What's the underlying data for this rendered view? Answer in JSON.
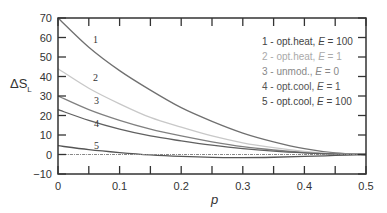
{
  "chart_data": {
    "type": "line",
    "title": "",
    "xlabel": "p",
    "ylabel": "ΔS_L",
    "xlim": [
      0,
      0.5
    ],
    "ylim": [
      -10,
      70
    ],
    "xticks": [
      0,
      0.1,
      0.2,
      0.3,
      0.4,
      0.5
    ],
    "xtick_labels": [
      "0",
      "0.1",
      "0.2",
      "0.3",
      "0.4",
      "0.5"
    ],
    "yticks": [
      -10,
      0,
      10,
      20,
      30,
      40,
      50,
      60,
      70
    ],
    "ytick_labels": [
      "-10",
      "0",
      "10",
      "20",
      "30",
      "40",
      "50",
      "60",
      "70"
    ],
    "grid": false,
    "legend_position": "upper right",
    "x": [
      0,
      0.05,
      0.1,
      0.15,
      0.2,
      0.25,
      0.3,
      0.35,
      0.4,
      0.45,
      0.5
    ],
    "series": [
      {
        "id": "1",
        "name": "1 - opt.heat, E=100",
        "color": "#707070",
        "values": [
          70,
          55,
          43,
          33,
          24,
          17,
          11,
          6.5,
          3,
          0.8,
          0
        ]
      },
      {
        "id": "2",
        "name": "2 - opt.heat, E=1",
        "color": "#c8c8c8",
        "values": [
          44,
          34,
          26,
          19,
          14,
          9.5,
          6,
          3.5,
          1.6,
          0.4,
          0
        ]
      },
      {
        "id": "3",
        "name": "3 - unmod., E=0",
        "color": "#808080",
        "values": [
          30,
          23,
          17.5,
          13,
          9.5,
          6.5,
          4,
          2.3,
          1,
          0.3,
          0
        ]
      },
      {
        "id": "4",
        "name": "4 - opt.cool, E=1",
        "color": "#606060",
        "values": [
          23,
          17.5,
          13,
          9.5,
          7,
          4.8,
          3,
          1.7,
          0.8,
          0.2,
          0
        ]
      },
      {
        "id": "5",
        "name": "5 - opt.cool, E=100",
        "color": "#555555",
        "values": [
          4.5,
          2.5,
          1,
          -0.2,
          -1,
          -1.5,
          -1.6,
          -1.4,
          -1,
          -0.5,
          0
        ]
      },
      {
        "id": "ref",
        "name": "zero reference",
        "color": "#888888",
        "dashed": true,
        "values": [
          0,
          0,
          0,
          0,
          0,
          0,
          0,
          0,
          0,
          0,
          0
        ]
      }
    ]
  },
  "legend": {
    "items": [
      {
        "num": "1 - ",
        "text": "opt.heat, ",
        "e": "E",
        "eq": " = 100",
        "color": "#444444"
      },
      {
        "num": "2 - ",
        "text": "opt.heat, ",
        "e": "E",
        "eq": " = 1",
        "color": "#aaaaaa"
      },
      {
        "num": "3 - ",
        "text": "unmod., ",
        "e": "E",
        "eq": " = 0",
        "color": "#888888"
      },
      {
        "num": "4 - ",
        "text": "opt.cool, ",
        "e": "E",
        "eq": " = 1",
        "color": "#555555"
      },
      {
        "num": "5 - ",
        "text": "opt.cool, ",
        "e": "E",
        "eq": " = 100",
        "color": "#444444"
      }
    ]
  },
  "curve_labels": [
    "1",
    "2",
    "3",
    "4",
    "5"
  ],
  "axis": {
    "ylabel_main": "ΔS",
    "ylabel_sub": "L",
    "xlabel": "p"
  }
}
